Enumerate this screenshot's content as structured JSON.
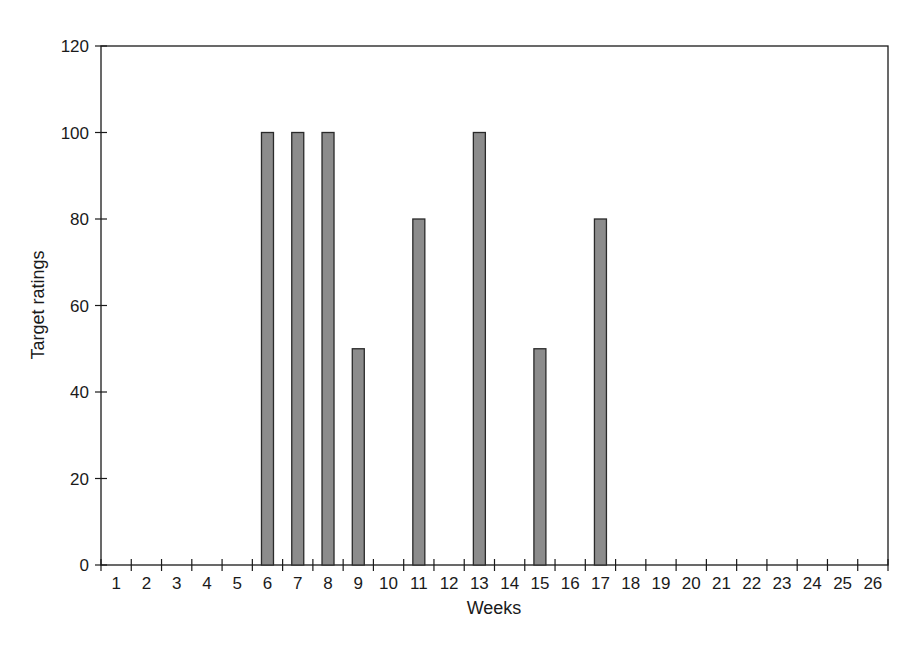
{
  "chart_data": {
    "type": "bar",
    "title": "",
    "xlabel": "Weeks",
    "ylabel": "Target ratings",
    "categories": [
      "1",
      "2",
      "3",
      "4",
      "5",
      "6",
      "7",
      "8",
      "9",
      "10",
      "11",
      "12",
      "13",
      "14",
      "15",
      "16",
      "17",
      "18",
      "19",
      "20",
      "21",
      "22",
      "23",
      "24",
      "25",
      "26"
    ],
    "values": [
      0,
      0,
      0,
      0,
      0,
      100,
      100,
      100,
      50,
      0,
      80,
      0,
      100,
      0,
      50,
      0,
      80,
      0,
      0,
      0,
      0,
      0,
      0,
      0,
      0,
      0
    ],
    "ylim": [
      0,
      120
    ],
    "yticks": [
      0,
      20,
      40,
      60,
      80,
      100,
      120
    ],
    "grid": false,
    "legend": null,
    "colors": {
      "bar_fill": "#8c8c8c",
      "bar_stroke": "#2a2a2a",
      "axis": "#1a1a1a"
    }
  }
}
